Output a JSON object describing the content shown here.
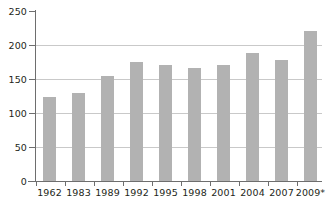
{
  "chart_data": {
    "type": "bar",
    "title": "",
    "subtitle": "",
    "xlabel": "",
    "ylabel": "",
    "categories": [
      "1962",
      "1983",
      "1989",
      "1992",
      "1995",
      "1998",
      "2001",
      "2004",
      "2007",
      "2009*"
    ],
    "values": [
      123,
      129,
      154,
      175,
      171,
      166,
      170,
      188,
      178,
      221
    ],
    "series": [
      {
        "name": "",
        "values": [
          123,
          129,
          154,
          175,
          171,
          166,
          170,
          188,
          178,
          221
        ]
      }
    ],
    "ylim": [
      0,
      250
    ],
    "ytick_labels": [
      "0",
      "50",
      "100",
      "150",
      "200",
      "250"
    ],
    "ytick_values": [
      0,
      50,
      100,
      150,
      200,
      250
    ],
    "grid": true,
    "grid_axis": "y",
    "legend": false,
    "legend_position": "none",
    "annotations": [],
    "bar_color": "#b2b2b2",
    "grid_color": "#c9c9c9",
    "axis_color": "#6e6e6e",
    "text_color": "#231f20",
    "background_color": "#ffffff"
  }
}
